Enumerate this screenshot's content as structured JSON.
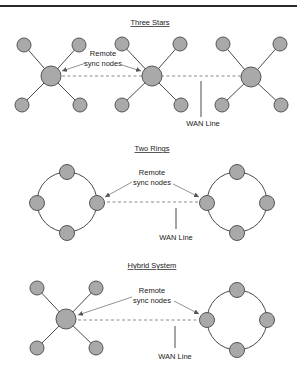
{
  "colors": {
    "node_fill": "#a9a9a9",
    "node_stroke": "#555555",
    "edge": "#4a4a4a",
    "wan_line": "#8a8a8a",
    "text": "#222222"
  },
  "sections": [
    {
      "title": "Three Stars",
      "callout_line1": "Remote",
      "callout_line2": "sync nodes",
      "wan_label": "WAN Line"
    },
    {
      "title": "Two Rings",
      "callout_line1": "Remote",
      "callout_line2": "sync nodes",
      "wan_label": "WAN Line"
    },
    {
      "title": "Hybrid System",
      "callout_line1": "Remote",
      "callout_line2": "sync nodes",
      "wan_label": "WAN Line"
    }
  ]
}
